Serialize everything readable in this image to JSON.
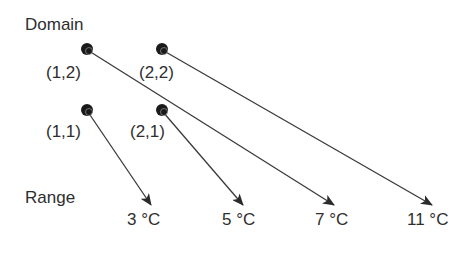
{
  "labels": {
    "domain": "Domain",
    "range": "Range"
  },
  "domain_points": [
    {
      "id": "p11",
      "label": "(1,1)",
      "x": 87,
      "y": 110,
      "label_x": 46,
      "label_y": 121
    },
    {
      "id": "p21",
      "label": "(2,1)",
      "x": 162,
      "y": 110,
      "label_x": 130,
      "label_y": 121
    },
    {
      "id": "p12",
      "label": "(1,2)",
      "x": 87,
      "y": 49,
      "label_x": 46,
      "label_y": 62
    },
    {
      "id": "p22",
      "label": "(2,2)",
      "x": 162,
      "y": 49,
      "label_x": 138,
      "label_y": 62
    }
  ],
  "range_values": [
    {
      "id": "r3",
      "label": "3 °C",
      "x": 127,
      "y": 210,
      "tip_x": 151,
      "tip_y": 205
    },
    {
      "id": "r5",
      "label": "5 °C",
      "x": 222,
      "y": 210,
      "tip_x": 243,
      "tip_y": 205
    },
    {
      "id": "r7",
      "label": "7 °C",
      "x": 316,
      "y": 210,
      "tip_x": 334,
      "tip_y": 205
    },
    {
      "id": "r11",
      "label": "11 °C",
      "x": 407,
      "y": 210,
      "tip_x": 432,
      "tip_y": 205
    }
  ],
  "mappings": [
    {
      "from": "(1,1)",
      "to": "3 °C"
    },
    {
      "from": "(2,1)",
      "to": "5 °C"
    },
    {
      "from": "(1,2)",
      "to": "7 °C"
    },
    {
      "from": "(2,2)",
      "to": "11 °C"
    }
  ],
  "colors": {
    "line": "#3a3a3a",
    "dot": "#1a1a1a",
    "text": "#2e2e2e"
  }
}
